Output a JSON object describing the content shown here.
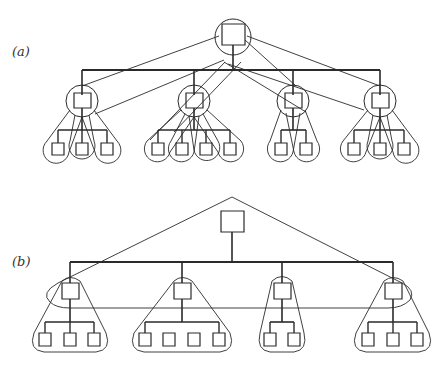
{
  "figure": {
    "panels": [
      {
        "label": "(a)",
        "description": "Two-level hierarchy with overlapping enclosures: each node encircled, child clusters enclosed in teardrop-shaped groupings, and root connected by long tangent lines",
        "root": {
          "id": "a-root"
        },
        "children": [
          {
            "id": "a-c1",
            "grandchildren": 3
          },
          {
            "id": "a-c2",
            "grandchildren": 4
          },
          {
            "id": "a-c3",
            "grandchildren": 2
          },
          {
            "id": "a-c4",
            "grandchildren": 3
          }
        ]
      },
      {
        "label": "(b)",
        "description": "Same two-level hierarchy with simplified enclosures: one triangle over root and first level, one rounded triangle per child cluster",
        "root": {
          "id": "b-root"
        },
        "children": [
          {
            "id": "b-c1",
            "grandchildren": 3
          },
          {
            "id": "b-c2",
            "grandchildren": 4
          },
          {
            "id": "b-c3",
            "grandchildren": 2
          },
          {
            "id": "b-c4",
            "grandchildren": 3
          }
        ]
      }
    ],
    "colors": {
      "stroke": "#2a2a2a",
      "background": "#ffffff"
    }
  }
}
